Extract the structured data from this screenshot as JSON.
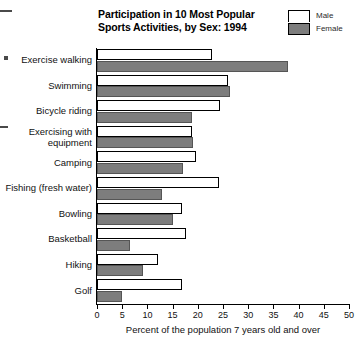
{
  "chart_data": {
    "type": "bar",
    "orientation": "horizontal",
    "title": "Participation in 10 Most Popular Sports Activities, by Sex: 1994",
    "title_lines": [
      "Participation in 10 Most Popular",
      "Sports Activities, by Sex: 1994"
    ],
    "xlabel": "Percent of the population 7 years old and over",
    "ylabel": "",
    "xlim": [
      0,
      50
    ],
    "xticks": [
      0,
      5,
      10,
      15,
      20,
      25,
      30,
      35,
      40,
      45,
      50
    ],
    "xtick_labels": [
      "0",
      "5",
      "10",
      "15",
      "20",
      "25",
      "30",
      "35",
      "40",
      "45",
      "50"
    ],
    "grid": false,
    "legend_position": "top-right",
    "categories": [
      "Exercise walking",
      "Swimming",
      "Bicycle riding",
      "Exercising with\nequipment",
      "Camping",
      "Fishing (fresh water)",
      "Bowling",
      "Basketball",
      "Hiking",
      "Golf"
    ],
    "series": [
      {
        "name": "Male",
        "color": "#ffffff",
        "values": [
          22.8,
          26.0,
          24.4,
          18.8,
          19.6,
          24.2,
          16.9,
          17.7,
          12.1,
          16.9
        ]
      },
      {
        "name": "Female",
        "color": "#7d7d7d",
        "values": [
          37.9,
          26.4,
          18.8,
          19.0,
          17.0,
          12.9,
          15.1,
          6.5,
          9.1,
          5.0
        ]
      }
    ]
  },
  "legend": {
    "items": [
      {
        "label": "Male",
        "swatch": "white-swatch"
      },
      {
        "label": "Female",
        "swatch": "gray-swatch"
      }
    ]
  }
}
